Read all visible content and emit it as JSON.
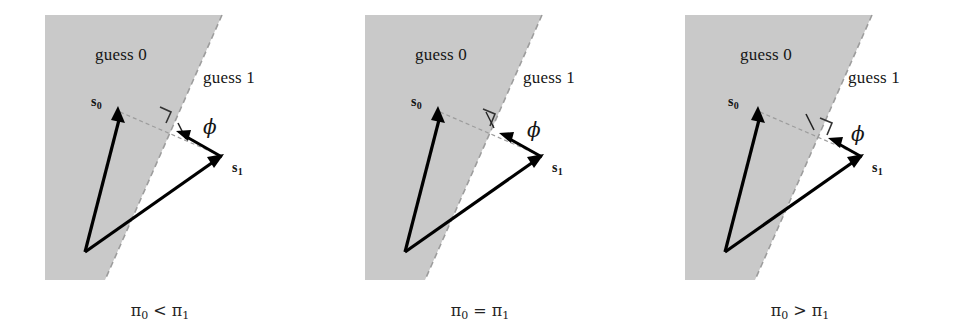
{
  "figure": {
    "background_color": "#ffffff",
    "shade_color": "#c8c8c8",
    "line_color": "#000000",
    "dash_color": "#9a9a9a",
    "panel_count": 3
  },
  "panels": [
    {
      "id": "panel-pi0-less-pi1",
      "region_label_0": "guess 0",
      "region_label_1": "guess 1",
      "vector_0_label": "s",
      "vector_0_sub": "0",
      "vector_1_label": "s",
      "vector_1_sub": "1",
      "phi_label": "ϕ",
      "caption": {
        "lhs": "π",
        "lhs_sub": "0",
        "relation": "<",
        "rhs": "π",
        "rhs_sub": "1"
      },
      "geometry": {
        "origin": [
          85,
          252
        ],
        "s0_tip": [
          118,
          110
        ],
        "s1_tip": [
          222,
          157
        ],
        "boundary_top": [
          222,
          15
        ],
        "boundary_bottom": [
          105,
          280
        ],
        "perp_foot": [
          166,
          118
        ],
        "midpoint_tick": [
          182,
          131
        ],
        "phi_arrow_from": [
          222,
          157
        ],
        "phi_arrow_to": [
          178,
          133
        ]
      }
    },
    {
      "id": "panel-pi0-equal-pi1",
      "region_label_0": "guess 0",
      "region_label_1": "guess 1",
      "vector_0_label": "s",
      "vector_0_sub": "0",
      "vector_1_label": "s",
      "vector_1_sub": "1",
      "phi_label": "ϕ",
      "caption": {
        "lhs": "π",
        "lhs_sub": "0",
        "relation": "=",
        "rhs": "π",
        "rhs_sub": "1"
      },
      "geometry": {
        "origin": [
          85,
          252
        ],
        "s0_tip": [
          118,
          110
        ],
        "s1_tip": [
          222,
          157
        ],
        "boundary_top": [
          222,
          15
        ],
        "boundary_bottom": [
          105,
          280
        ],
        "perp_foot": [
          170,
          120
        ],
        "midpoint_tick": [
          170,
          120
        ],
        "phi_arrow_from": [
          222,
          157
        ],
        "phi_arrow_to": [
          181,
          134
        ]
      }
    },
    {
      "id": "panel-pi0-greater-pi1",
      "region_label_0": "guess 0",
      "region_label_1": "guess 1",
      "vector_0_label": "s",
      "vector_0_sub": "0",
      "vector_1_label": "s",
      "vector_1_sub": "1",
      "phi_label": "ϕ",
      "caption": {
        "lhs": "π",
        "lhs_sub": "0",
        "relation": ">",
        "rhs": "π",
        "rhs_sub": "1"
      },
      "geometry": {
        "origin": [
          85,
          252
        ],
        "s0_tip": [
          118,
          110
        ],
        "s1_tip": [
          222,
          157
        ],
        "boundary_top": [
          222,
          15
        ],
        "boundary_bottom": [
          105,
          280
        ],
        "perp_foot": [
          187,
          131
        ],
        "midpoint_tick": [
          170,
          123
        ],
        "phi_arrow_from": [
          222,
          157
        ],
        "phi_arrow_to": [
          190,
          139
        ]
      }
    }
  ]
}
